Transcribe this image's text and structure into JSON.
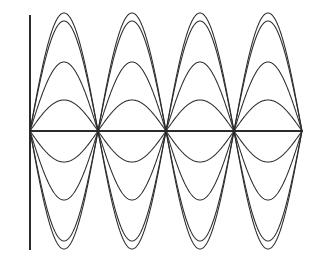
{
  "figure": {
    "title": "",
    "background_color": "#ffffff",
    "line_color": "#2b2b2b",
    "width": 320,
    "height": 262
  },
  "axes": {
    "x_axis_label": "",
    "y_axis_label": "",
    "origin_px": {
      "x": 30,
      "y": 131
    },
    "x_axis": {
      "name": "horizontal-axis",
      "x_start_px": 30,
      "x_end_px": 302,
      "y_px": 131
    },
    "y_axis": {
      "name": "vertical-axis",
      "x_px": 30,
      "y_top_px": 15,
      "y_bottom_px": 250
    },
    "grid": false,
    "legend": "none",
    "tick_labels_x": [],
    "tick_labels_y": []
  },
  "chart_data": {
    "type": "line",
    "title": "",
    "subtitle": "",
    "xlabel": "",
    "ylabel": "",
    "grid": false,
    "legend": "none",
    "xlim": [
      0,
      12.566370614359172
    ],
    "ylim": [
      -1.0,
      1.0
    ],
    "x_unit": "radians",
    "x_nodes": [
      0,
      6.283185307179586,
      12.566370614359172
    ],
    "x_nodes_px": [
      30,
      166,
      302
    ],
    "series": [
      {
        "name": "A = 1.00",
        "amplitude": 1.0,
        "amplitude_px": 118,
        "peak_y_px": 13,
        "trough_y_px": 249
      },
      {
        "name": "A = 0.93",
        "amplitude": 0.93,
        "amplitude_px": 110,
        "peak_y_px": 21,
        "trough_y_px": 241
      },
      {
        "name": "A = 0.58",
        "amplitude": 0.58,
        "amplitude_px": 69,
        "peak_y_px": 62,
        "trough_y_px": 200
      },
      {
        "name": "A = 0.26",
        "amplitude": 0.26,
        "amplitude_px": 31,
        "peak_y_px": 100,
        "trough_y_px": 162
      },
      {
        "name": "A = -0.26",
        "amplitude": -0.26,
        "amplitude_px": -31,
        "peak_y_px": 162,
        "trough_y_px": 100
      },
      {
        "name": "A = -0.58",
        "amplitude": -0.58,
        "amplitude_px": -69,
        "peak_y_px": 200,
        "trough_y_px": 62
      },
      {
        "name": "A = -0.93",
        "amplitude": -0.93,
        "amplitude_px": -110,
        "peak_y_px": 241,
        "trough_y_px": 21
      },
      {
        "name": "A = -1.00",
        "amplitude": -1.0,
        "amplitude_px": -118,
        "peak_y_px": 249,
        "trough_y_px": 13
      }
    ],
    "x": [
      0,
      0.5,
      1.0,
      1.5708,
      2.0,
      2.5,
      3.1416,
      3.5,
      4.0,
      4.7124,
      5.0,
      5.5,
      6.2832,
      6.7832,
      7.2832,
      7.854,
      8.2832,
      8.7832,
      9.4248,
      9.9248,
      10.4248,
      11.0,
      11.5,
      12.5664
    ]
  }
}
